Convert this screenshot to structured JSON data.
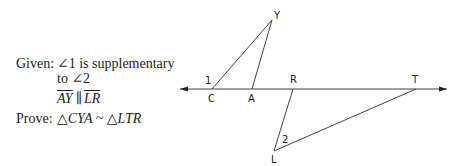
{
  "problem": {
    "given_label": "Given:",
    "given_line1": "∠1 is supplementary",
    "given_line2": "to ∠2",
    "parallel_seg1": "AY",
    "parallel_symbol": "∥",
    "parallel_seg2": "LR",
    "prove_label": "Prove:",
    "prove_statement": "△CYA ~ △LTR"
  },
  "diagram": {
    "points": {
      "C": {
        "label": "C",
        "x": 212,
        "y": 89
      },
      "A": {
        "label": "A",
        "x": 252,
        "y": 89
      },
      "Y": {
        "label": "Y",
        "x": 272,
        "y": 20
      },
      "R": {
        "label": "R",
        "x": 293,
        "y": 89
      },
      "T": {
        "label": "T",
        "x": 416,
        "y": 89
      },
      "L": {
        "label": "L",
        "x": 274,
        "y": 151
      }
    },
    "angle_labels": {
      "angle1": "1",
      "angle2": "2"
    },
    "line": {
      "x1": 180,
      "x2": 447,
      "y": 89
    },
    "stroke_color": "#444444"
  }
}
